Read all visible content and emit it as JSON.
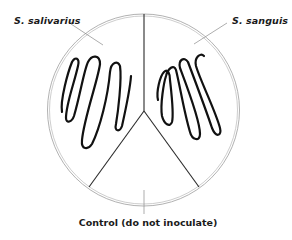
{
  "diagram": {
    "labels": {
      "left_section": "S. salivarius",
      "right_section": "S. sanguis",
      "bottom_section": "Control (do not inoculate)"
    },
    "sections": [
      {
        "name": "S. salivarius",
        "position": "upper-left",
        "inoculated": true,
        "streak_pattern": "serpentine"
      },
      {
        "name": "S. sanguis",
        "position": "upper-right",
        "inoculated": true,
        "streak_pattern": "serpentine"
      },
      {
        "name": "Control (do not inoculate)",
        "position": "bottom",
        "inoculated": false
      }
    ],
    "colors": {
      "plate_rim": "#9a9a9a",
      "divider": "#2a2a2a",
      "streak": "#111111",
      "leader": "#8a8a8a",
      "text": "#1a1a1a"
    }
  }
}
